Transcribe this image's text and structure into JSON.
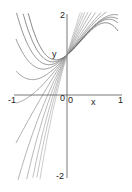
{
  "chart_data": {
    "type": "line",
    "title": "",
    "xlabel": "x",
    "ylabel": "y",
    "xlim": [
      -1,
      1
    ],
    "ylim": [
      -2,
      2
    ],
    "x_ticks": [
      "-1",
      "0",
      "1"
    ],
    "y_ticks": [
      "2",
      "0",
      "-2"
    ],
    "grid": false,
    "legend": null,
    "series": [
      {
        "name": "curve-1",
        "a": -2.0,
        "b": 1.6,
        "c": 1.0
      },
      {
        "name": "curve-2",
        "a": -1.6,
        "b": 1.3,
        "c": 1.1
      },
      {
        "name": "curve-3",
        "a": -1.3,
        "b": 1.0,
        "c": 1.2
      },
      {
        "name": "curve-4",
        "a": -1.0,
        "b": 0.7,
        "c": 1.3
      },
      {
        "name": "curve-5",
        "a": -0.7,
        "b": 0.4,
        "c": 1.5
      },
      {
        "name": "curve-6",
        "a": -0.4,
        "b": 0.1,
        "c": 1.7
      },
      {
        "name": "curve-7",
        "a": 0.0,
        "b": -0.2,
        "c": 2.0
      },
      {
        "name": "curve-8",
        "a": 0.4,
        "b": -0.5,
        "c": 2.4
      },
      {
        "name": "curve-9",
        "a": 0.8,
        "b": -0.8,
        "c": 2.8
      },
      {
        "name": "curve-10",
        "a": 1.2,
        "b": -1.1,
        "c": 3.3
      },
      {
        "name": "curve-11",
        "a": 1.6,
        "b": -1.4,
        "c": 3.8
      },
      {
        "name": "curve-12",
        "a": 2.0,
        "b": -1.7,
        "c": 4.4
      }
    ]
  },
  "labels": {
    "y_top": "2",
    "y_bottom": "-2",
    "x_left": "-1",
    "x_right": "1",
    "origin_y": "0",
    "origin_x": "0",
    "x_axis": "x",
    "y_axis": "y"
  },
  "colors": {
    "axis": "#555555",
    "curve_dark": "#333333",
    "curve_light": "#aaaaaa"
  }
}
